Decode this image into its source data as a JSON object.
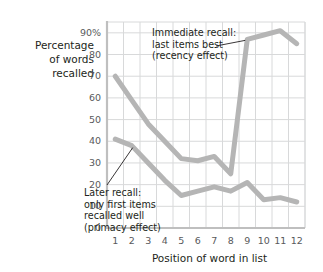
{
  "chart_data": {
    "type": "line",
    "title": "",
    "xlabel": "Position of word in list",
    "ylabel": "Percentage of words recalled",
    "categories": [
      1,
      2,
      3,
      4,
      5,
      6,
      7,
      8,
      9,
      10,
      11,
      12
    ],
    "x": [
      1,
      2,
      3,
      4,
      5,
      6,
      7,
      8,
      9,
      10,
      11,
      12
    ],
    "xlim": [
      0.5,
      12.5
    ],
    "ylim": [
      0,
      95
    ],
    "yticks": [
      0,
      10,
      20,
      30,
      40,
      50,
      60,
      70,
      80,
      90
    ],
    "ytick_labels": [
      "0",
      "10",
      "20",
      "30",
      "40",
      "50",
      "60",
      "70",
      "80",
      "90%"
    ],
    "xtick_labels": [
      "1",
      "2",
      "3",
      "4",
      "5",
      "6",
      "7",
      "8",
      "9",
      "10",
      "11",
      "12"
    ],
    "grid": true,
    "legend": "none",
    "line_color": "#b5b5b5",
    "grid_color": "#d8d9da",
    "axis_color": "#bfbfbf",
    "series": [
      {
        "name": "Immediate recall",
        "values": [
          70,
          59,
          48,
          40,
          32,
          31,
          33,
          25,
          87,
          89,
          91,
          85
        ]
      },
      {
        "name": "Later recall",
        "values": [
          41,
          38,
          30,
          22,
          15,
          17,
          19,
          17,
          21,
          13,
          14,
          12
        ]
      }
    ],
    "annotations": [
      {
        "name": "immediate-recall-annotation",
        "lines": [
          "Immediate recall:",
          "last items best",
          "(recency effect)"
        ],
        "points_to_series": "Immediate recall",
        "points_to_x": 9
      },
      {
        "name": "later-recall-annotation",
        "lines": [
          "Later recall:",
          "only first items",
          "recalled well",
          "(primacy effect)"
        ],
        "points_to_series": "Later recall",
        "points_to_x": 2
      }
    ]
  },
  "axis": {
    "ylabel_lines": [
      "Percentage",
      "of words",
      "recalled"
    ],
    "xlabel": "Position of word in list"
  }
}
